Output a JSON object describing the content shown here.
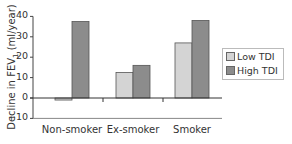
{
  "chart_data": {
    "type": "bar",
    "title": "",
    "xlabel": "",
    "ylabel": "Decline in FEV1 (ml/year)",
    "ylabel_main": "Decline in FEV",
    "ylabel_sub": "1",
    "ylabel_unit": " (ml/year)",
    "ylim": [
      -10,
      40
    ],
    "yticks": [
      -10,
      0,
      10,
      20,
      30,
      40
    ],
    "categories": [
      "Non-smoker",
      "Ex-smoker",
      "Smoker"
    ],
    "series": [
      {
        "name": "Low TDI",
        "color": "#d4d4d4",
        "values": [
          -1,
          12.5,
          27
        ]
      },
      {
        "name": "High TDI",
        "color": "#8c8c8c",
        "values": [
          37.5,
          16,
          38
        ]
      }
    ],
    "grid": false,
    "legend_position": "right"
  },
  "legend": {
    "items": [
      {
        "label": "Low TDI",
        "color": "#d4d4d4"
      },
      {
        "label": "High TDI",
        "color": "#8c8c8c"
      }
    ]
  }
}
